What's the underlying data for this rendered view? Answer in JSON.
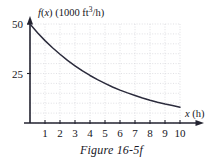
{
  "figure": {
    "caption": "Figure 16-5f"
  },
  "chart_data": {
    "type": "line",
    "title": "",
    "xlabel": "x (h)",
    "xlabel_var": "x",
    "xlabel_unit": "(h)",
    "ylabel": "f(x) (1000 ft³/h)",
    "ylabel_func": "f(x)",
    "ylabel_unit": "(1000 ft³/h)",
    "xlim": [
      0,
      10
    ],
    "ylim": [
      0,
      50
    ],
    "xticks": [
      1,
      2,
      3,
      4,
      5,
      6,
      7,
      8,
      9,
      10
    ],
    "xtick_labels": [
      "1",
      "2",
      "3",
      "4",
      "5",
      "6",
      "7",
      "8",
      "9",
      "10"
    ],
    "yticks": [
      25,
      50
    ],
    "ytick_labels": [
      "25",
      "50"
    ],
    "grid": true,
    "grid_x_step": 1,
    "grid_y_step": 5,
    "legend": "none",
    "series": [
      {
        "name": "f(x)",
        "color": "#2b2b3c",
        "x": [
          0,
          0.5,
          1,
          1.5,
          2,
          2.5,
          3,
          3.5,
          4,
          4.5,
          5,
          5.5,
          6,
          6.5,
          7,
          7.5,
          8,
          8.5,
          9,
          9.5,
          10
        ],
        "values": [
          50.0,
          45.6,
          41.6,
          38.0,
          34.7,
          31.6,
          28.9,
          26.3,
          24.0,
          21.9,
          20.0,
          18.2,
          16.6,
          15.2,
          13.9,
          12.6,
          11.5,
          10.5,
          9.6,
          8.8,
          8.0
        ]
      }
    ]
  },
  "colors": {
    "curve": "#2b2b3c",
    "axis": "#232330",
    "grid": "#d2d2d8",
    "background": "#ffffff"
  }
}
